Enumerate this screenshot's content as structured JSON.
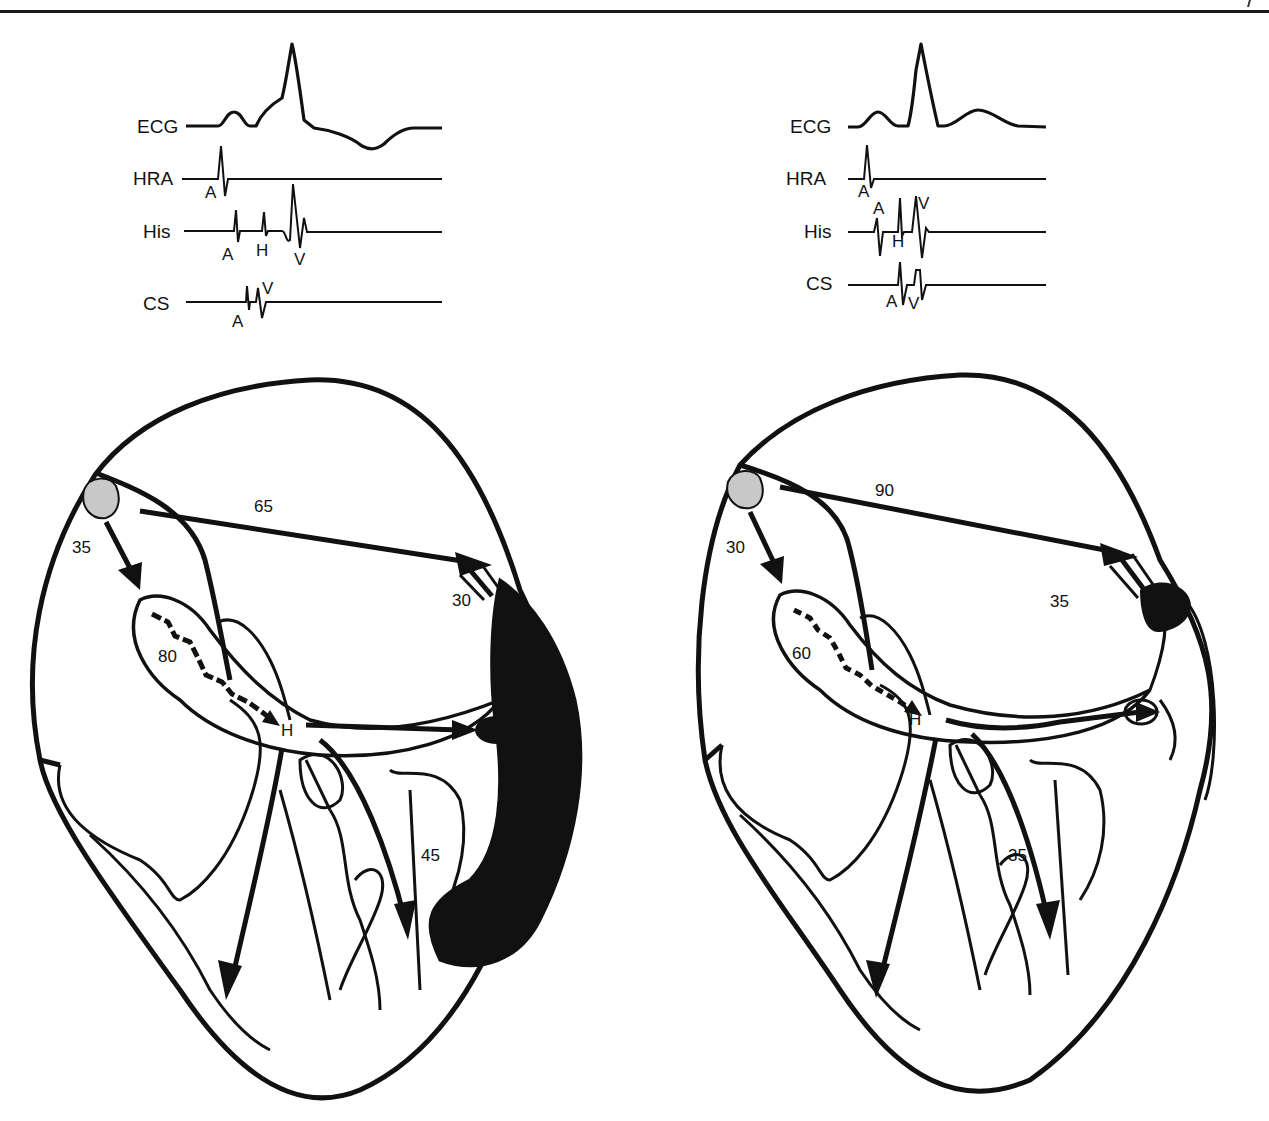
{
  "figure": {
    "panels": [
      {
        "id": "left",
        "traces": [
          {
            "label": "ECG"
          },
          {
            "label": "HRA",
            "markers": [
              "A"
            ]
          },
          {
            "label": "His",
            "markers": [
              "A",
              "H",
              "V"
            ]
          },
          {
            "label": "CS",
            "markers": [
              "A",
              "V"
            ]
          }
        ],
        "heart": {
          "sa_to_av_time": "35",
          "sa_to_lateral_time": "65",
          "av_node_time": "80",
          "lateral_av_time": "30",
          "his_label": "H",
          "ventricular_time": "45",
          "preexcited_region": "large"
        }
      },
      {
        "id": "right",
        "traces": [
          {
            "label": "ECG"
          },
          {
            "label": "HRA",
            "markers": [
              "A"
            ]
          },
          {
            "label": "His",
            "markers": [
              "A",
              "H",
              "V"
            ]
          },
          {
            "label": "CS",
            "markers": [
              "A",
              "V"
            ]
          }
        ],
        "heart": {
          "sa_to_av_time": "30",
          "sa_to_lateral_time": "90",
          "av_node_time": "60",
          "lateral_av_time": "35",
          "his_label": "H",
          "ventricular_time": "35",
          "preexcited_region": "small"
        }
      }
    ],
    "colors": {
      "ink": "#111111",
      "sa_node_fill": "#c8c8c8",
      "background": "#ffffff"
    }
  }
}
